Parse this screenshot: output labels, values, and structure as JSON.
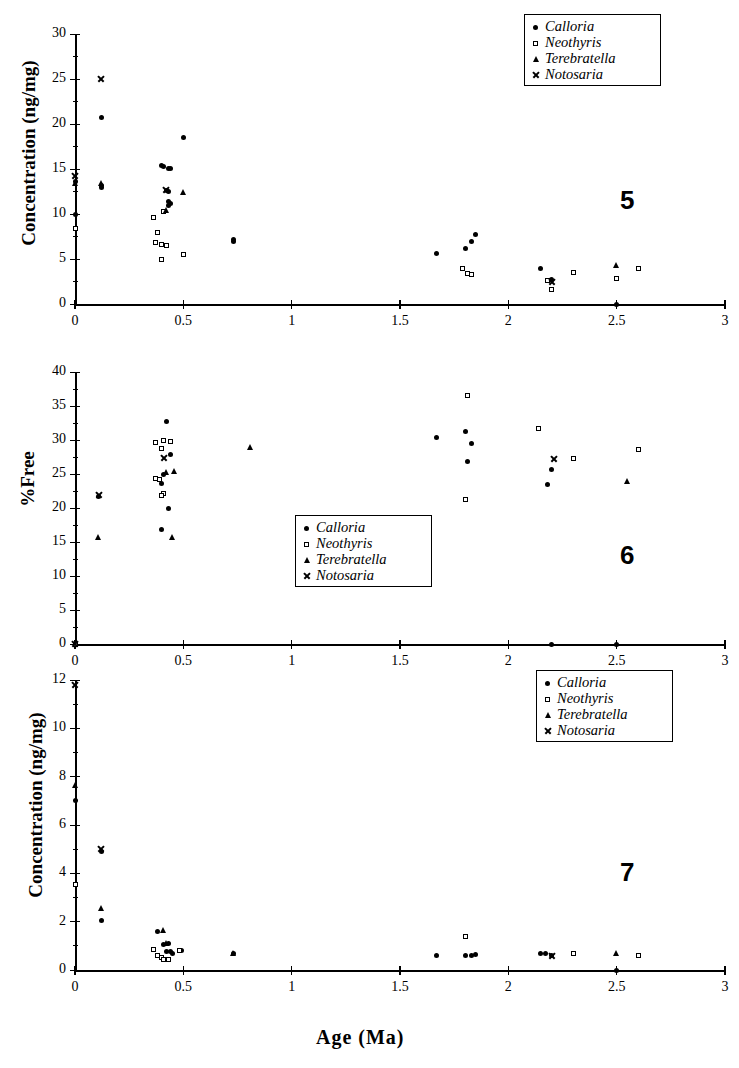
{
  "figure": {
    "xaxis_title": "Age  (Ma)",
    "legend_labels": {
      "calloria": "Calloria",
      "neothyris": "Neothyris",
      "terebratella": "Terebratella",
      "notosaria": "Notosaria"
    },
    "marker_names": {
      "calloria": "filled-circle-marker",
      "neothyris": "open-square-marker",
      "terebratella": "filled-triangle-marker",
      "notosaria": "cross-marker"
    }
  },
  "chart_data": [
    {
      "type": "scatter",
      "panel_number": "5",
      "title": "",
      "xlabel": "Age  (Ma)",
      "ylabel": "Concentration (ng/mg)",
      "xlim": [
        0,
        3
      ],
      "ylim": [
        0,
        30
      ],
      "xticks": [
        "0",
        "0.5",
        "1",
        "1.5",
        "2",
        "2.5",
        "3"
      ],
      "xtick_values": [
        0,
        0.5,
        1,
        1.5,
        2,
        2.5,
        3
      ],
      "yticks": [
        "0",
        "5",
        "10",
        "15",
        "20",
        "25",
        "30"
      ],
      "ytick_values": [
        0,
        5,
        10,
        15,
        20,
        25,
        30
      ],
      "grid": false,
      "legend_position": "top-right",
      "series": [
        {
          "name": "Calloria",
          "marker": "circle",
          "points": [
            [
              0.0,
              13.6
            ],
            [
              0.0,
              9.9
            ],
            [
              0.12,
              20.7
            ],
            [
              0.12,
              13.2
            ],
            [
              0.12,
              12.9
            ],
            [
              0.4,
              15.4
            ],
            [
              0.41,
              15.3
            ],
            [
              0.43,
              15.1
            ],
            [
              0.44,
              15.1
            ],
            [
              0.42,
              12.6
            ],
            [
              0.43,
              12.5
            ],
            [
              0.43,
              11.4
            ],
            [
              0.44,
              11.2
            ],
            [
              0.43,
              10.9
            ],
            [
              0.5,
              18.5
            ],
            [
              0.73,
              7.2
            ],
            [
              0.73,
              7.0
            ],
            [
              1.67,
              5.6
            ],
            [
              1.8,
              6.2
            ],
            [
              1.83,
              6.9
            ],
            [
              1.85,
              7.7
            ],
            [
              2.15,
              3.9
            ],
            [
              2.2,
              2.7
            ],
            [
              2.5,
              0.0
            ]
          ]
        },
        {
          "name": "Neothyris",
          "marker": "square",
          "points": [
            [
              0.0,
              8.4
            ],
            [
              0.36,
              9.6
            ],
            [
              0.41,
              10.3
            ],
            [
              0.38,
              7.9
            ],
            [
              0.37,
              6.8
            ],
            [
              0.4,
              6.6
            ],
            [
              0.42,
              6.5
            ],
            [
              0.4,
              5.0
            ],
            [
              0.5,
              5.5
            ],
            [
              1.79,
              4.0
            ],
            [
              1.81,
              3.4
            ],
            [
              1.83,
              3.3
            ],
            [
              2.18,
              2.6
            ],
            [
              2.2,
              1.6
            ],
            [
              2.3,
              3.5
            ],
            [
              2.5,
              2.8
            ],
            [
              2.6,
              3.9
            ]
          ]
        },
        {
          "name": "Terebratella",
          "marker": "triangle",
          "points": [
            [
              0.0,
              13.5
            ],
            [
              0.12,
              13.4
            ],
            [
              0.42,
              10.5
            ],
            [
              0.5,
              12.5
            ],
            [
              2.5,
              4.3
            ]
          ]
        },
        {
          "name": "Notosaria",
          "marker": "cross",
          "points": [
            [
              0.0,
              14.3
            ],
            [
              0.12,
              25.0
            ],
            [
              0.42,
              12.7
            ],
            [
              2.2,
              2.5
            ]
          ]
        }
      ]
    },
    {
      "type": "scatter",
      "panel_number": "6",
      "title": "",
      "xlabel": "Age  (Ma)",
      "ylabel": "%Free",
      "xlim": [
        0,
        3
      ],
      "ylim": [
        0,
        40
      ],
      "xticks": [
        "0",
        "0.5",
        "1",
        "1.5",
        "2",
        "2.5",
        "3"
      ],
      "xtick_values": [
        0,
        0.5,
        1,
        1.5,
        2,
        2.5,
        3
      ],
      "yticks": [
        "0",
        "5",
        "10",
        "15",
        "20",
        "25",
        "30",
        "35",
        "40"
      ],
      "ytick_values": [
        0,
        5,
        10,
        15,
        20,
        25,
        30,
        35,
        40
      ],
      "grid": false,
      "legend_position": "bottom-center",
      "series": [
        {
          "name": "Calloria",
          "marker": "circle",
          "points": [
            [
              0.0,
              0.0
            ],
            [
              0.11,
              21.7
            ],
            [
              0.42,
              32.7
            ],
            [
              0.44,
              27.8
            ],
            [
              0.41,
              24.9
            ],
            [
              0.4,
              23.6
            ],
            [
              0.43,
              19.9
            ],
            [
              0.4,
              16.8
            ],
            [
              1.67,
              30.3
            ],
            [
              1.8,
              31.3
            ],
            [
              1.83,
              29.5
            ],
            [
              1.81,
              26.8
            ],
            [
              2.18,
              23.4
            ],
            [
              2.2,
              25.7
            ],
            [
              2.5,
              0.0
            ],
            [
              2.2,
              0.0
            ]
          ]
        },
        {
          "name": "Neothyris",
          "marker": "square",
          "points": [
            [
              0.0,
              0.0
            ],
            [
              0.37,
              29.6
            ],
            [
              0.41,
              29.9
            ],
            [
              0.44,
              29.8
            ],
            [
              0.4,
              28.7
            ],
            [
              0.37,
              24.3
            ],
            [
              0.39,
              24.2
            ],
            [
              0.41,
              22.2
            ],
            [
              0.4,
              21.9
            ],
            [
              1.81,
              36.5
            ],
            [
              1.8,
              21.2
            ],
            [
              2.14,
              31.7
            ],
            [
              2.3,
              27.3
            ],
            [
              2.6,
              28.6
            ]
          ]
        },
        {
          "name": "Terebratella",
          "marker": "triangle",
          "points": [
            [
              0.11,
              15.7
            ],
            [
              0.42,
              25.3
            ],
            [
              0.46,
              25.4
            ],
            [
              0.45,
              15.8
            ],
            [
              0.81,
              28.9
            ],
            [
              2.55,
              24.0
            ]
          ]
        },
        {
          "name": "Notosaria",
          "marker": "cross",
          "points": [
            [
              0.0,
              0.0
            ],
            [
              0.11,
              22.0
            ],
            [
              0.41,
              27.4
            ],
            [
              2.21,
              27.3
            ]
          ]
        }
      ]
    },
    {
      "type": "scatter",
      "panel_number": "7",
      "title": "",
      "xlabel": "Age  (Ma)",
      "ylabel": "Concentration  (ng/mg)",
      "xlim": [
        0,
        3
      ],
      "ylim": [
        0,
        12
      ],
      "xticks": [
        "0",
        "0.5",
        "1",
        "1.5",
        "2",
        "2.5",
        "3"
      ],
      "xtick_values": [
        0,
        0.5,
        1,
        1.5,
        2,
        2.5,
        3
      ],
      "yticks": [
        "0",
        "2",
        "4",
        "6",
        "8",
        "10",
        "12"
      ],
      "ytick_values": [
        0,
        2,
        4,
        6,
        8,
        10,
        12
      ],
      "grid": false,
      "legend_position": "top-right",
      "series": [
        {
          "name": "Calloria",
          "marker": "circle",
          "points": [
            [
              0.0,
              7.0
            ],
            [
              0.12,
              4.9
            ],
            [
              0.12,
              2.05
            ],
            [
              0.38,
              1.6
            ],
            [
              0.41,
              1.05
            ],
            [
              0.43,
              1.1
            ],
            [
              0.42,
              0.75
            ],
            [
              0.44,
              0.75
            ],
            [
              0.45,
              0.7
            ],
            [
              0.49,
              0.8
            ],
            [
              0.73,
              0.7
            ],
            [
              1.67,
              0.62
            ],
            [
              1.8,
              0.6
            ],
            [
              1.83,
              0.62
            ],
            [
              1.85,
              0.65
            ],
            [
              2.15,
              0.7
            ],
            [
              2.17,
              0.68
            ],
            [
              2.2,
              0.6
            ],
            [
              2.5,
              0.0
            ]
          ]
        },
        {
          "name": "Neothyris",
          "marker": "square",
          "points": [
            [
              0.0,
              3.55
            ],
            [
              0.36,
              0.85
            ],
            [
              0.38,
              0.62
            ],
            [
              0.4,
              0.52
            ],
            [
              0.41,
              0.45
            ],
            [
              0.43,
              0.45
            ],
            [
              0.48,
              0.8
            ],
            [
              1.8,
              1.4
            ],
            [
              2.3,
              0.7
            ],
            [
              2.6,
              0.62
            ]
          ]
        },
        {
          "name": "Terebratella",
          "marker": "triangle",
          "points": [
            [
              0.0,
              7.65
            ],
            [
              0.12,
              2.55
            ],
            [
              0.41,
              1.65
            ],
            [
              0.42,
              1.1
            ],
            [
              0.73,
              0.7
            ],
            [
              2.5,
              0.7
            ]
          ]
        },
        {
          "name": "Notosaria",
          "marker": "cross",
          "points": [
            [
              0.0,
              11.8
            ],
            [
              0.12,
              5.0
            ],
            [
              2.2,
              0.6
            ]
          ]
        }
      ]
    }
  ]
}
